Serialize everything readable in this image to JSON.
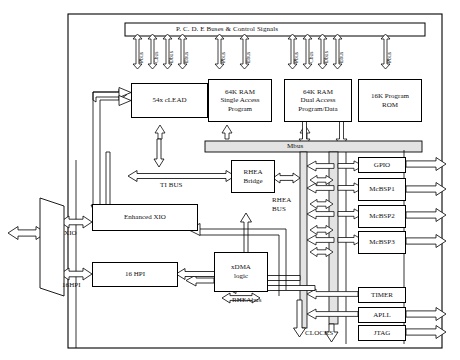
{
  "diagram": {
    "top_bus": {
      "label": "P. C. D. E Buses & Control Signals"
    },
    "bus_arrow_labels": {
      "pbus": "Pbus",
      "cbus": "Cbus",
      "dbus": "Dbus",
      "ebus": "Ebus"
    },
    "core_blocks": [
      {
        "id": "clead",
        "lines": [
          "54x cLEAD"
        ],
        "emphasis": true
      },
      {
        "id": "ram_sa",
        "lines": [
          "64K RAM",
          "Single Access",
          "Program"
        ],
        "emphasis": false
      },
      {
        "id": "ram_da",
        "lines": [
          "64K RAM",
          "Dual Access",
          "Program/Data"
        ],
        "emphasis": true
      },
      {
        "id": "rom",
        "lines": [
          "16K Program",
          "ROM"
        ],
        "emphasis": false
      }
    ],
    "mbus": {
      "label": "Mbus"
    },
    "bridge": {
      "lines": [
        "RHEA",
        "Bridge"
      ]
    },
    "xdma": {
      "lines": [
        "xDMA",
        "logic"
      ]
    },
    "xio": {
      "label": "Enhanced XIO"
    },
    "hpi": {
      "label": "16 HPI"
    },
    "bus_names": {
      "ti_bus": "TI BUS",
      "rhea_bus_line1": "RHEA",
      "rhea_bus_line2": "BUS",
      "rheabus": "RHEAbus",
      "clocks": "CLOCKS"
    },
    "port_labels": {
      "xio": "XIO",
      "hpi": "16HPI"
    },
    "peripherals": [
      {
        "id": "gpio",
        "label": "GPIO",
        "external": true
      },
      {
        "id": "mcbsp1",
        "label": "McBSP1",
        "external": true
      },
      {
        "id": "mcbsp2",
        "label": "McBSP2",
        "external": true
      },
      {
        "id": "mcbsp3",
        "label": "McBSP3",
        "external": true
      },
      {
        "id": "timer",
        "label": "TIMER",
        "external": false
      },
      {
        "id": "apll",
        "label": "APLL",
        "external": true
      },
      {
        "id": "jtag",
        "label": "JTAG",
        "external": true
      }
    ],
    "colors": {
      "line": "#000000",
      "fill": "#ffffff",
      "shade": "#e3e3e3"
    }
  }
}
